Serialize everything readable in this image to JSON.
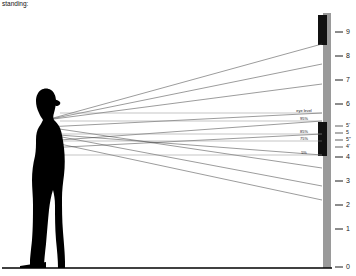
{
  "title": "standing:",
  "colors": {
    "mirror": "#111111",
    "wall": "#9a9a9a",
    "person": "#000000",
    "ray": "#4a4a4a",
    "level_line": "#8a8a8a",
    "ground": "#000000",
    "background": "#ffffff"
  },
  "scale": {
    "name": "height-scale",
    "unit_label": "",
    "major_ticks": [
      {
        "value": "9",
        "y": 32
      },
      {
        "value": "8",
        "y": 56
      },
      {
        "value": "7",
        "y": 80
      },
      {
        "value": "6",
        "y": 104
      },
      {
        "value": "5",
        "y": 133
      },
      {
        "value": "4",
        "y": 157
      },
      {
        "value": "3",
        "y": 181
      },
      {
        "value": "2",
        "y": 205
      },
      {
        "value": "1",
        "y": 229
      },
      {
        "value": "0",
        "y": 267
      }
    ],
    "minor_ticks": [
      {
        "value": "5'",
        "y": 126
      },
      {
        "value": "5",
        "y": 133
      },
      {
        "value": "5\"",
        "y": 140
      },
      {
        "value": "4'",
        "y": 147
      }
    ]
  },
  "measurements": [
    {
      "name": "eye-level",
      "label": "eye level",
      "y": 111,
      "x": 304
    },
    {
      "name": "mirror-top-pct",
      "label": "95%",
      "y": 118,
      "x": 304
    },
    {
      "name": "mirror-mid-pct",
      "label": "85%",
      "y": 132,
      "x": 304
    },
    {
      "name": "mirror-low-pct",
      "label": "75%",
      "y": 139,
      "x": 304
    },
    {
      "name": "mirror-bottom-pct",
      "label": "5%",
      "y": 153,
      "x": 304
    }
  ],
  "level_lines": [
    {
      "name": "level-line-eye",
      "y": 113,
      "x1": 60,
      "x2": 322
    },
    {
      "name": "level-line-95",
      "y": 121,
      "x1": 60,
      "x2": 322
    },
    {
      "name": "level-line-85",
      "y": 134,
      "x1": 60,
      "x2": 322
    },
    {
      "name": "level-line-75",
      "y": 141,
      "x1": 60,
      "x2": 322
    },
    {
      "name": "level-line-5",
      "y": 155,
      "x1": 60,
      "x2": 322
    }
  ],
  "mirror_segments": [
    {
      "name": "mirror-upper",
      "x": 318,
      "y": 15,
      "w": 9,
      "h": 30
    },
    {
      "name": "mirror-lower",
      "x": 318,
      "y": 122,
      "w": 9,
      "h": 34
    }
  ],
  "wall": {
    "name": "wall",
    "x": 323,
    "y": 13,
    "w": 8,
    "h": 255
  },
  "person": {
    "name": "person-silhouette",
    "eye_x": 46,
    "eye_y": 120
  },
  "ground": {
    "name": "ground-line",
    "y": 268,
    "x1": 2,
    "x2": 330
  },
  "rays": [
    {
      "name": "ray-1",
      "x1": 46,
      "y1": 120,
      "x2": 322,
      "y2": 44
    },
    {
      "name": "ray-2",
      "x1": 46,
      "y1": 120,
      "x2": 322,
      "y2": 64
    },
    {
      "name": "ray-3",
      "x1": 46,
      "y1": 120,
      "x2": 322,
      "y2": 84
    },
    {
      "name": "ray-4",
      "x1": 46,
      "y1": 127,
      "x2": 322,
      "y2": 113
    },
    {
      "name": "ray-5",
      "x1": 46,
      "y1": 127,
      "x2": 322,
      "y2": 168
    },
    {
      "name": "ray-6",
      "x1": 46,
      "y1": 134,
      "x2": 322,
      "y2": 155
    },
    {
      "name": "ray-7",
      "x1": 46,
      "y1": 134,
      "x2": 322,
      "y2": 186
    },
    {
      "name": "ray-8",
      "x1": 46,
      "y1": 141,
      "x2": 322,
      "y2": 121
    },
    {
      "name": "ray-9",
      "x1": 46,
      "y1": 141,
      "x2": 322,
      "y2": 200
    },
    {
      "name": "ray-10",
      "x1": 46,
      "y1": 148,
      "x2": 322,
      "y2": 134
    }
  ]
}
